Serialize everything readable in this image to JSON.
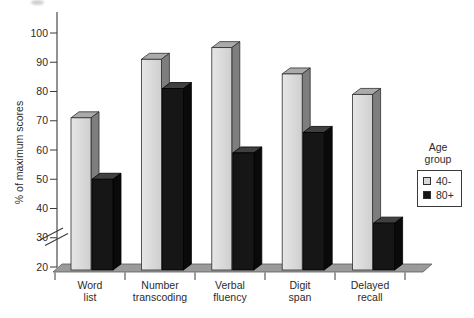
{
  "chart_data": {
    "type": "bar",
    "title": "",
    "xlabel": "",
    "ylabel": "% of maximum scores",
    "categories": [
      "Word list",
      "Number transcoding",
      "Verbal fluency",
      "Digit span",
      "Delayed recall"
    ],
    "series": [
      {
        "name": "40-",
        "values": [
          71,
          91,
          95,
          86,
          79
        ]
      },
      {
        "name": "80+",
        "values": [
          50,
          81,
          59,
          66,
          35
        ]
      }
    ],
    "ylim": [
      20,
      100
    ],
    "yticks": [
      20,
      30,
      40,
      50,
      60,
      70,
      80,
      90,
      100
    ],
    "axis_break": true,
    "axis_break_location": "y-axis between 20 and 30",
    "grid": false,
    "style": "3d-offset-bars",
    "legend": {
      "title": "Age group",
      "position": "right-middle",
      "entries": [
        "40-",
        "80+"
      ]
    }
  },
  "colors": {
    "background": "#ffffff",
    "light_front": "#d8d8d8",
    "light_front_hi": "#e4e4e4",
    "light_top": "#aaaaaa",
    "light_side": "#7e7e7e",
    "light_outline": "#2e2e2e",
    "dark_front": "#161616",
    "dark_top": "#404040",
    "dark_side": "#0a0a0a",
    "dark_outline": "#000000",
    "floor": "#9b9b9b",
    "floor_outline": "#5a5a5a",
    "axis": "#3a3a3a",
    "text": "#2b2b2b"
  }
}
